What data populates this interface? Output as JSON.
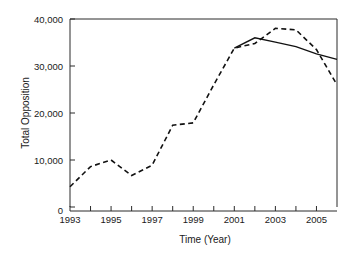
{
  "chart_data": {
    "type": "line",
    "title": "",
    "xlabel": "Time (Year)",
    "ylabel": "Total Opposition",
    "xlim": [
      1993,
      2006
    ],
    "ylim": [
      0,
      40000
    ],
    "grid": false,
    "legend": "none",
    "x_ticks": [
      1993,
      1994,
      1995,
      1996,
      1997,
      1998,
      1999,
      2000,
      2001,
      2002,
      2003,
      2004,
      2005,
      2006
    ],
    "x_tick_labels": [
      "1993",
      "",
      "1995",
      "",
      "1997",
      "",
      "1999",
      "",
      "2001",
      "",
      "2003",
      "",
      "2005",
      ""
    ],
    "y_ticks": [
      0,
      10000,
      20000,
      30000,
      40000
    ],
    "y_tick_labels": [
      "0",
      "10,000",
      "20,000",
      "30,000",
      "40,000"
    ],
    "series": [
      {
        "name": "observed",
        "style": "dashed",
        "x": [
          1993,
          1994,
          1995,
          1996,
          1997,
          1998,
          1999,
          2000,
          2001,
          2002,
          2003,
          2004,
          2005,
          2006
        ],
        "values": [
          4300,
          8600,
          10000,
          6700,
          8900,
          17400,
          17900,
          26000,
          33800,
          34800,
          38000,
          37700,
          33500,
          26000
        ]
      },
      {
        "name": "trend",
        "style": "solid",
        "x": [
          2001,
          2002,
          2003,
          2004,
          2005,
          2006
        ],
        "values": [
          33800,
          36000,
          35100,
          34100,
          32600,
          31400
        ]
      }
    ]
  },
  "axis": {
    "y_label": "Total Opposition",
    "x_label": "Time (Year)"
  }
}
